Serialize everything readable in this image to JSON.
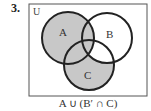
{
  "problem_number": "3.",
  "universe_label": "U",
  "sets": [
    {
      "label": "A",
      "cx": 68,
      "cy": 38,
      "r": 26
    },
    {
      "label": "B",
      "cx": 107,
      "cy": 38,
      "r": 25
    },
    {
      "label": "C",
      "cx": 89,
      "cy": 65,
      "r": 25
    }
  ],
  "shaded_expression": "A ∪ (B′ ∩ C)",
  "shaded_regions": "A ∪ (C ∖ B)",
  "colors": {
    "shade": "#c8c8c8",
    "stroke": "#222222",
    "frame": "#555555"
  }
}
